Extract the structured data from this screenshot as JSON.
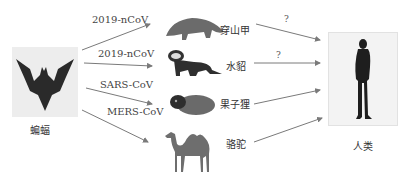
{
  "source": {
    "label": "蝙蝠",
    "icon": "bat-icon"
  },
  "target": {
    "label": "人类",
    "icon": "human-silhouette-icon"
  },
  "virus_links": [
    {
      "virus": "2019-nCoV",
      "host": "穿山甲",
      "icon": "pangolin-icon"
    },
    {
      "virus": "2019-nCoV",
      "host": "水貂",
      "icon": "mink-icon"
    },
    {
      "virus": "SARS-CoV",
      "host": "果子狸",
      "icon": "civet-icon"
    },
    {
      "virus": "MERS-CoV",
      "host": "骆驼",
      "icon": "camel-icon"
    }
  ],
  "host_to_human": [
    {
      "host": "穿山甲",
      "label": "?"
    },
    {
      "host": "水貂",
      "label": "?"
    },
    {
      "host": "果子狸",
      "label": ""
    },
    {
      "host": "骆驼",
      "label": ""
    }
  ],
  "colors": {
    "arrow": "#7a7a7a",
    "silhouette": "#1e1e1e",
    "animal": "#555555"
  }
}
